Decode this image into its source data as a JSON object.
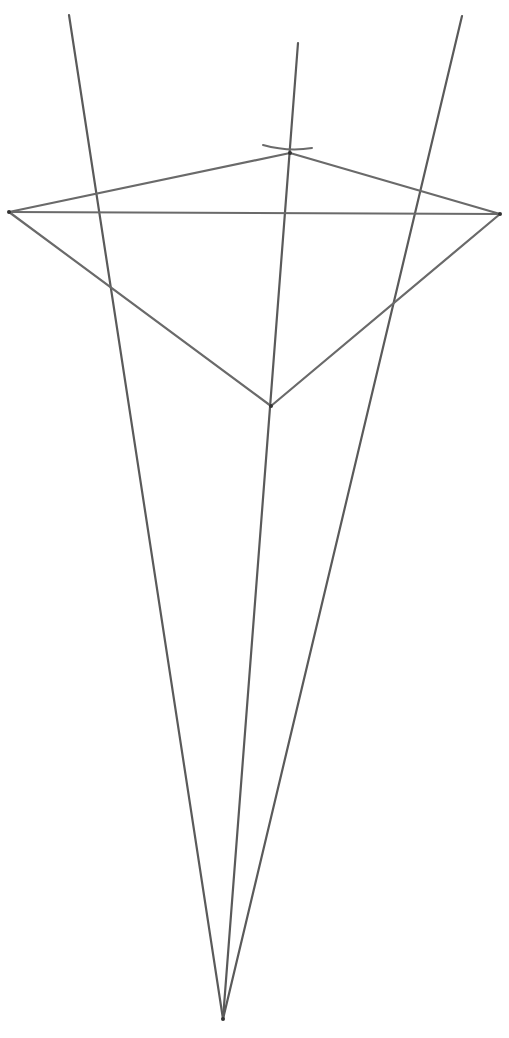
{
  "diagram": {
    "apex": {
      "x": 223,
      "y": 1019
    },
    "rays": [
      {
        "name": "left-ray",
        "from": [
          223,
          1019
        ],
        "to": [
          69,
          15
        ]
      },
      {
        "name": "middle-ray",
        "from": [
          223,
          1019
        ],
        "to": [
          298,
          43
        ]
      },
      {
        "name": "right-ray",
        "from": [
          223,
          1019
        ],
        "to": [
          462,
          16
        ]
      }
    ],
    "quadrilateral": {
      "vertices": {
        "left": [
          9,
          212
        ],
        "top": [
          290,
          153
        ],
        "right": [
          500,
          214
        ],
        "bottom": [
          271,
          406
        ]
      }
    },
    "diagonal": {
      "from": [
        9,
        212
      ],
      "to": [
        500,
        214
      ]
    },
    "arc_mark": {
      "from": [
        263,
        145
      ],
      "to": [
        312,
        148
      ]
    },
    "colors": {
      "line": "#5a5a5a",
      "background": "#ffffff"
    }
  }
}
